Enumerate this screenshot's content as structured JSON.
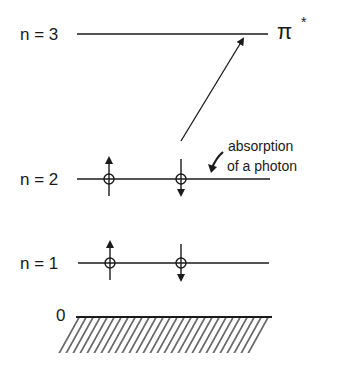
{
  "diagram": {
    "levels": [
      {
        "label": "n = 3",
        "y": 34,
        "orbital": "π",
        "orbital_sup": "*"
      },
      {
        "label": "n = 2",
        "y": 179
      },
      {
        "label": "n = 1",
        "y": 263
      }
    ],
    "baseline": {
      "label": "0",
      "y": 317
    },
    "annotation": {
      "line1": "absorption",
      "line2": "of a photon"
    },
    "electrons": {
      "n2": [
        {
          "x": 109,
          "spin": "up"
        },
        {
          "x": 181,
          "spin": "down"
        }
      ],
      "n1": [
        {
          "x": 110,
          "spin": "up"
        },
        {
          "x": 181,
          "spin": "down"
        }
      ]
    },
    "transition": {
      "from": [
        181,
        141
      ],
      "to": [
        245,
        37
      ]
    },
    "colors": {
      "ink": "#1a1a1a",
      "background": "#ffffff"
    }
  }
}
